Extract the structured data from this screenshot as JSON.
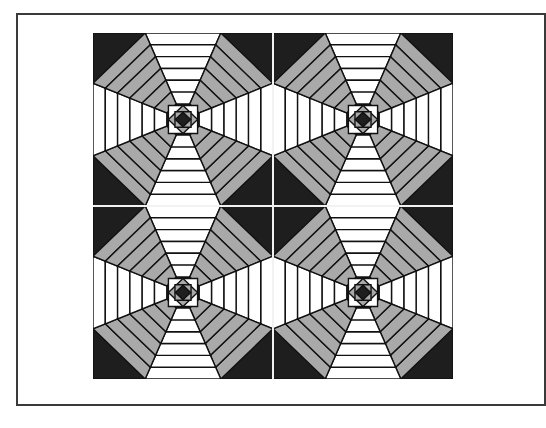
{
  "figure": {
    "layout": {
      "rows": 2,
      "cols": 2
    },
    "colors": {
      "dark": "#1e1e1e",
      "medium": "#a9a9a9",
      "light": "#ffffff",
      "line": "#111111",
      "seam": "#f2f2f2",
      "frame": "#3a3a3a"
    },
    "block": {
      "center": "dark-diamond-in-square",
      "rings": [
        {
          "axis": "light",
          "diagonal": "medium"
        },
        {
          "axis": "light",
          "diagonal": "medium"
        },
        {
          "axis": "light",
          "diagonal": "medium"
        },
        {
          "axis": "light",
          "diagonal": "medium"
        },
        {
          "axis": "light",
          "diagonal": "medium"
        },
        {
          "axis": "light",
          "diagonal": "medium"
        }
      ],
      "corners": "dark"
    }
  }
}
